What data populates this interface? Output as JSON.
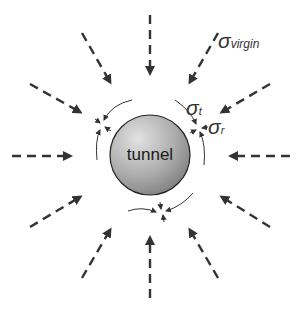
{
  "diagram": {
    "title": "",
    "center_label": "tunnel",
    "labels": {
      "sigma_virgin": {
        "symbol": "σ",
        "subscript": "virgin"
      },
      "sigma_t": {
        "symbol": "σ",
        "subscript": "t"
      },
      "sigma_r": {
        "symbol": "σ",
        "subscript": "r"
      }
    },
    "colors": {
      "arrow": "#333333",
      "tunnel_fill_light": "#d8d8d8",
      "tunnel_fill_dark": "#8a8a8a",
      "tunnel_stroke": "#222222",
      "background": "#ffffff"
    },
    "virgin_stress_arrows": [
      {
        "id": "top",
        "from": [
          150,
          15
        ],
        "to": [
          150,
          73
        ]
      },
      {
        "id": "top-left",
        "from": [
          82,
          33
        ],
        "to": [
          110,
          82
        ]
      },
      {
        "id": "top-right",
        "from": [
          218,
          33
        ],
        "to": [
          190,
          82
        ]
      },
      {
        "id": "left-upper",
        "from": [
          30,
          84
        ],
        "to": [
          80,
          112
        ]
      },
      {
        "id": "right-upper",
        "from": [
          270,
          84
        ],
        "to": [
          222,
          112
        ]
      },
      {
        "id": "left",
        "from": [
          12,
          156
        ],
        "to": [
          70,
          156
        ]
      },
      {
        "id": "right",
        "from": [
          290,
          156
        ],
        "to": [
          231,
          156
        ]
      },
      {
        "id": "left-lower",
        "from": [
          30,
          227
        ],
        "to": [
          80,
          197
        ]
      },
      {
        "id": "right-lower",
        "from": [
          270,
          227
        ],
        "to": [
          222,
          197
        ]
      },
      {
        "id": "bottom-left",
        "from": [
          82,
          278
        ],
        "to": [
          110,
          230
        ]
      },
      {
        "id": "bottom-right",
        "from": [
          218,
          278
        ],
        "to": [
          190,
          230
        ]
      },
      {
        "id": "bottom",
        "from": [
          150,
          298
        ],
        "to": [
          150,
          238
        ]
      }
    ],
    "stress_nodes": [
      {
        "id": "upper-left",
        "at": [
          102,
          125
        ]
      },
      {
        "id": "upper-right",
        "at": [
          199,
          128
        ]
      },
      {
        "id": "bottom",
        "at": [
          162,
          212
        ]
      }
    ]
  }
}
